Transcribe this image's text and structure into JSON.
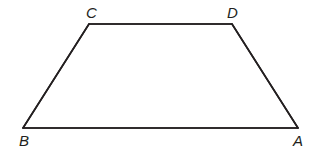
{
  "diagram": {
    "type": "trapezoid",
    "stroke_color": "#231f20",
    "background": "#ffffff",
    "vertices": [
      {
        "label": "A",
        "x": 298,
        "y": 128,
        "label_x": 293,
        "label_y": 146
      },
      {
        "label": "B",
        "x": 23,
        "y": 128,
        "label_x": 19,
        "label_y": 146
      },
      {
        "label": "C",
        "x": 89,
        "y": 24,
        "label_x": 86,
        "label_y": 18
      },
      {
        "label": "D",
        "x": 232,
        "y": 24,
        "label_x": 227,
        "label_y": 18
      }
    ],
    "edges": [
      {
        "name": "AB",
        "from": "A",
        "to": "B"
      },
      {
        "name": "BC",
        "from": "B",
        "to": "C"
      },
      {
        "name": "CD",
        "from": "C",
        "to": "D"
      },
      {
        "name": "DA",
        "from": "D",
        "to": "A"
      }
    ],
    "labels": {
      "A": "A",
      "B": "B",
      "C": "C",
      "D": "D"
    }
  }
}
